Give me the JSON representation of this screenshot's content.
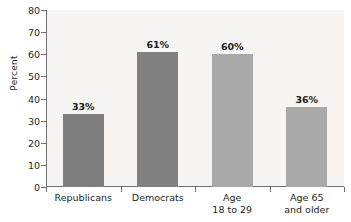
{
  "chart_data": {
    "type": "bar",
    "title": "",
    "subtitle": "",
    "xlabel": "",
    "ylabel": "Percent",
    "ylim": [
      0,
      80
    ],
    "ytick_values": [
      0,
      10,
      20,
      30,
      40,
      50,
      60,
      70,
      80
    ],
    "ytick_labels": [
      "0",
      "10",
      "20",
      "30",
      "40",
      "50",
      "60",
      "70",
      "80"
    ],
    "grid": false,
    "legend": false,
    "legend_position": "none",
    "categories": [
      "Republicans",
      "Democrats",
      "Age 18 to 29",
      "Age 65 and older"
    ],
    "category_lines": [
      [
        "Republicans"
      ],
      [
        "Democrats"
      ],
      [
        "Age",
        "18 to 29"
      ],
      [
        "Age 65",
        "and older"
      ]
    ],
    "values": [
      33,
      61,
      60,
      36
    ],
    "value_labels": [
      "33%",
      "61%",
      "60%",
      "36%"
    ],
    "bar_colors": [
      "#7f7f7f",
      "#808080",
      "#a9a9a9",
      "#a9a9a9"
    ],
    "colors": {
      "plot_background": "#f6f5f3",
      "page_background": "#ffffff",
      "axis": "#6e6e6e",
      "text": "#231f20",
      "value_label": "#1a1a1a",
      "bar_dark": "#7f7f7f",
      "bar_light": "#a9a9a9"
    }
  }
}
